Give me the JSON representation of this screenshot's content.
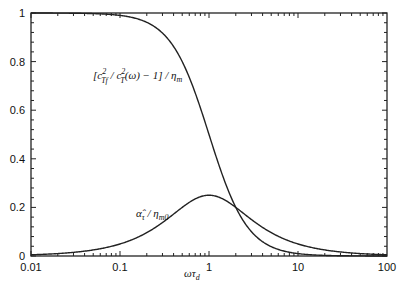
{
  "chart_data": {
    "type": "line",
    "title": "",
    "xlabel": "ωτ_d",
    "ylabel": "",
    "xscale": "log",
    "xlim": [
      0.01,
      100
    ],
    "ylim": [
      0,
      1
    ],
    "grid": false,
    "legend": "none (inline annotations)",
    "x_ticks": [
      "0.01",
      "0.1",
      "1",
      "10",
      "100"
    ],
    "y_ticks": [
      "0",
      "0.2",
      "0.4",
      "0.6",
      "0.8",
      "1"
    ],
    "series": [
      {
        "name": "[c_Tf^2 / c_T^2(ω) − 1] / η_m",
        "x": [
          0.01,
          0.03,
          0.1,
          0.2,
          0.3,
          0.5,
          0.7,
          1,
          1.5,
          2,
          3,
          5,
          10,
          30,
          100
        ],
        "values": [
          1.0,
          0.999,
          0.99,
          0.962,
          0.917,
          0.8,
          0.671,
          0.5,
          0.308,
          0.2,
          0.1,
          0.038,
          0.01,
          0.001,
          0.0
        ]
      },
      {
        "name": "α̂_τ / η_m0",
        "x": [
          0.01,
          0.03,
          0.1,
          0.2,
          0.3,
          0.5,
          0.7,
          1,
          1.5,
          2,
          3,
          5,
          10,
          30,
          100
        ],
        "values": [
          0.005,
          0.015,
          0.05,
          0.096,
          0.138,
          0.2,
          0.235,
          0.25,
          0.231,
          0.2,
          0.15,
          0.096,
          0.05,
          0.017,
          0.005
        ]
      }
    ],
    "annotations": [
      {
        "text": "[c²_Tf / c²_T(ω) − 1] / η_m",
        "near": "upper-left of falling curve"
      },
      {
        "text": "α̂_τ / η_m0",
        "near": "rising side of peaked curve"
      }
    ]
  },
  "labels": {
    "xlabel_main": "ωτ",
    "xlabel_sub": "d",
    "ann1_open": "[c",
    "ann1_sup1": "2",
    "ann1_sub1": "Tf",
    "ann1_mid": " / c",
    "ann1_sup2": "2",
    "ann1_sub2": "T",
    "ann1_rest": "(ω) − 1] / η",
    "ann1_sub3": "m",
    "ann2_main": "α̂",
    "ann2_sub1": "τ",
    "ann2_mid": " / η",
    "ann2_sub2": "m0"
  }
}
